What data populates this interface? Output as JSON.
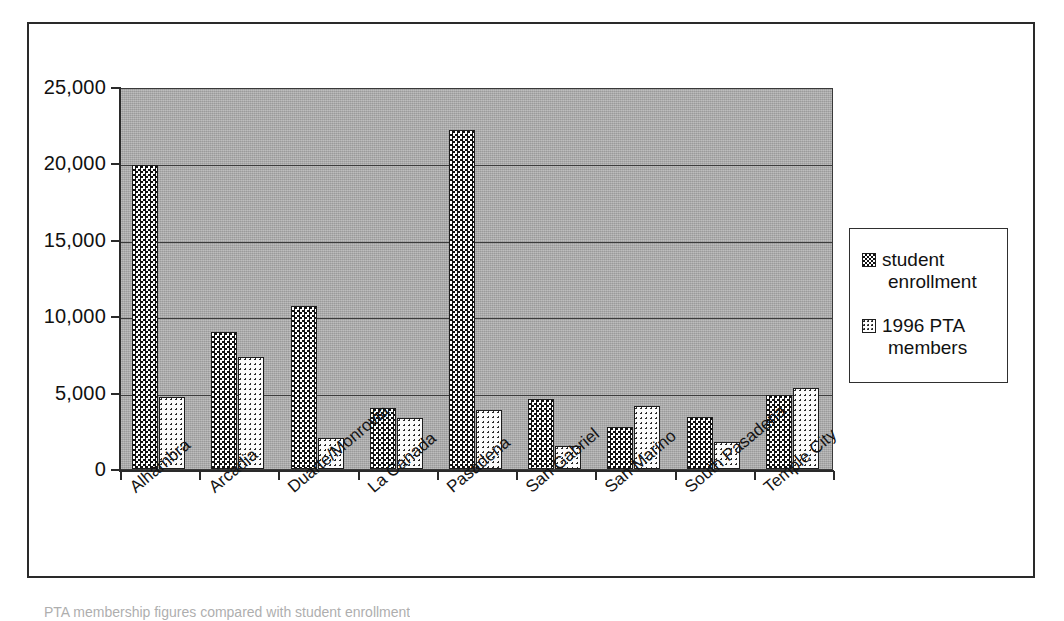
{
  "chart_data": {
    "type": "bar",
    "title": "",
    "xlabel": "",
    "ylabel": "",
    "ylim": [
      0,
      25000
    ],
    "grid": true,
    "legend_position": "right",
    "categories": [
      "Alhambra",
      "Arcadia",
      "Duarte/Monrovia",
      "La Canada",
      "Pasadena",
      "San Gabriel",
      "San Marino",
      "South Pasadena",
      "Temple City"
    ],
    "ytick_labels": [
      "0",
      "5,000",
      "10,000",
      "15,000",
      "20,000",
      "25,000"
    ],
    "ytick_values": [
      0,
      5000,
      10000,
      15000,
      20000,
      25000
    ],
    "series": [
      {
        "name": "student enrollment",
        "legend_line_1": "student",
        "legend_line_2": "enrollment",
        "pattern": "checkerboard-dark",
        "values": [
          19900,
          8950,
          10700,
          4000,
          22200,
          4600,
          2750,
          3400,
          4850
        ]
      },
      {
        "name": "1996 PTA members",
        "legend_line_1": "1996 PTA",
        "legend_line_2": "members",
        "pattern": "dotted-light",
        "values": [
          4700,
          7350,
          2050,
          3350,
          3850,
          1500,
          4150,
          1800,
          5300
        ]
      }
    ]
  },
  "colors": {
    "plot_background": "#a9a9a9",
    "gridline": "#3c3c3c",
    "axis": "#2a2a2a",
    "frame": "#2a2a2a",
    "text": "#111111",
    "legend_background": "#ffffff"
  },
  "caption": {
    "clipped_text": "PTA membership figures compared with student enrollment"
  }
}
